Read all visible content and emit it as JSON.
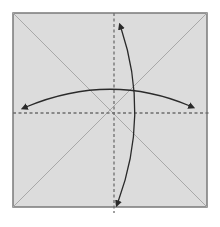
{
  "diagram": {
    "type": "origami-fold-diagram",
    "colors": {
      "background": "#ffffff",
      "paper_fill": "#dcdcdc",
      "paper_border": "#7a7a7a",
      "crease": "#a8a8a8",
      "dashed_fold": "#6e6e6e",
      "arrow": "#2a2a2a"
    },
    "paper": {
      "x": 13,
      "y": 13,
      "width": 194,
      "height": 194
    },
    "creases": [
      {
        "name": "diagonal-tl-br",
        "x1": 13,
        "y1": 13,
        "x2": 207,
        "y2": 207
      },
      {
        "name": "diagonal-tr-bl",
        "x1": 207,
        "y1": 13,
        "x2": 13,
        "y2": 207
      }
    ],
    "dashed_folds": [
      {
        "name": "vertical-center",
        "x1": 114,
        "y1": 13,
        "x2": 114,
        "y2": 213
      },
      {
        "name": "horizontal-center",
        "x1": 13,
        "y1": 113,
        "x2": 210,
        "y2": 113
      }
    ],
    "arrows": [
      {
        "name": "horizontal-double-arrow",
        "path": "M 26 107 Q 110 72 190 106"
      },
      {
        "name": "vertical-double-arrow",
        "path": "M 121 28 Q 150 115 118 202"
      }
    ]
  }
}
